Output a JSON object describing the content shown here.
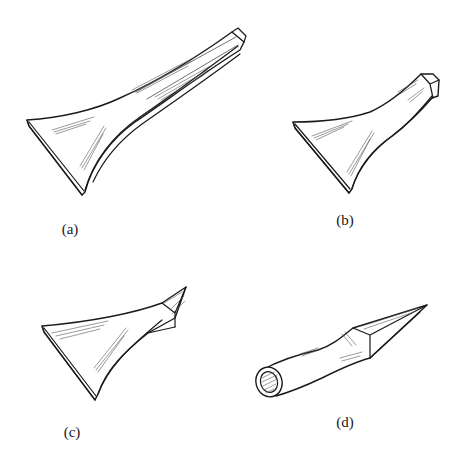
{
  "figure": {
    "panels": [
      {
        "id": "a",
        "label": "(a)",
        "description": "Scraper with long flat handle and wide curved blade"
      },
      {
        "id": "b",
        "label": "(b)",
        "description": "Scraper with short handle ending in square cap"
      },
      {
        "id": "c",
        "label": "(c)",
        "description": "Scraper with wide blade and pointed square tang"
      },
      {
        "id": "d",
        "label": "(d)",
        "description": "Pointed tool with round tubular handle and square tapered tip"
      }
    ]
  },
  "colors": {
    "ink": "#1a1a1a",
    "background": "#ffffff"
  }
}
